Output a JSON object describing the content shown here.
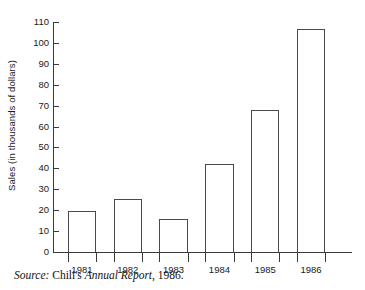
{
  "chart_data": {
    "type": "bar",
    "title": "",
    "subtitle": "",
    "xlabel": "",
    "ylabel": "Sales (in thousands of dollars)",
    "categories": [
      "1981",
      "1982",
      "1983",
      "1984",
      "1985",
      "1986"
    ],
    "values": [
      19.5,
      25.5,
      16,
      42,
      68,
      106.5
    ],
    "ylim": [
      0,
      110
    ],
    "ytick_values": [
      0,
      10,
      20,
      30,
      40,
      50,
      60,
      70,
      80,
      90,
      100,
      110
    ],
    "ytick_labels": [
      "0",
      "10",
      "20",
      "30",
      "40",
      "50",
      "60",
      "70",
      "80",
      "90",
      "100",
      "110"
    ],
    "grid": false,
    "legend": null,
    "bar_style": {
      "fill": "#ffffff",
      "edge": "#4a4a4a"
    }
  },
  "caption": {
    "source_word": "Source:",
    "company": "Chili's",
    "document": "Annual Report",
    "year": ", 1986."
  },
  "colors": {
    "axis": "#3a3a3a",
    "bar_edge": "#4a4a4a",
    "text": "#1a1a1a",
    "background": "#ffffff"
  }
}
